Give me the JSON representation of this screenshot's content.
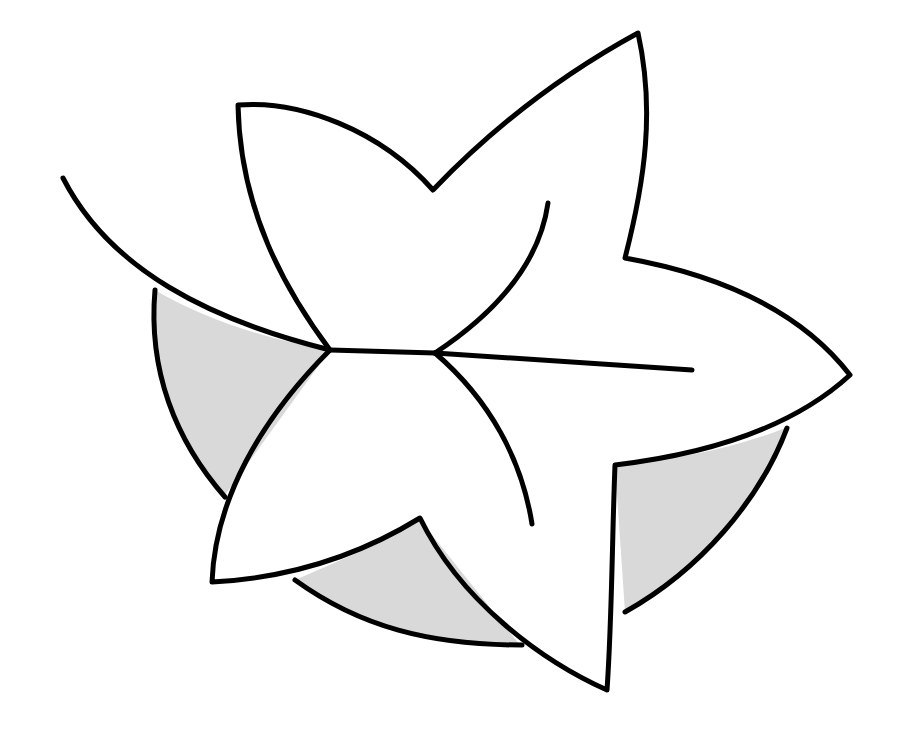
{
  "figure": {
    "title": "Star-shaped leaf over shaded circle",
    "colors": {
      "background": "#ffffff",
      "stroke": "#000000",
      "shade": "#d9d9d9"
    },
    "stroke_width": 5
  }
}
